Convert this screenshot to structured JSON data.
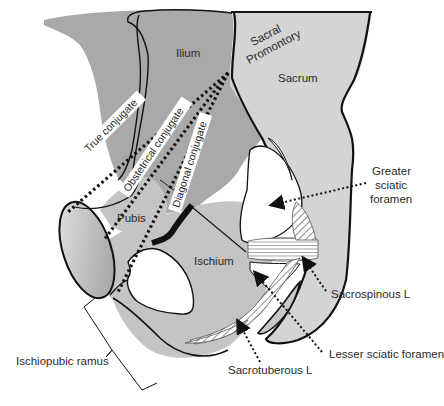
{
  "figure": {
    "type": "anatomical-diagram"
  },
  "colors": {
    "ilium_fill": "#a9a9a9",
    "sacrum_fill": "#d4d4d4",
    "pubis_ischium_fill": "#c4c4c4",
    "symphysis_fill": "#b8b8b8",
    "foramen_fill": "#ffffff",
    "outline": "#111111",
    "label_box": "#ffffff",
    "text": "#2a2a2a"
  },
  "bone_labels": {
    "ilium": "Ilium",
    "sacral_promontory_line1": "Sacral",
    "sacral_promontory_line2": "Promontory",
    "sacrum": "Sacrum",
    "pubis": "Pubis",
    "ischium": "Ischium"
  },
  "conjugate_labels": {
    "true": "True conjugate",
    "obstetrical": "Obstetrical conjugate",
    "diagonal": "Diagonal conjugate"
  },
  "callouts": {
    "greater_sciatic_line1": "Greater",
    "greater_sciatic_line2": "sciatic",
    "greater_sciatic_line3": "foramen",
    "sacrospinous": "Sacrospinous L",
    "lesser_sciatic": "Lesser sciatic foramen",
    "sacrotuberous": "Sacrotuberous L",
    "ischiopubic_ramus": "Ischiopubic ramus"
  }
}
